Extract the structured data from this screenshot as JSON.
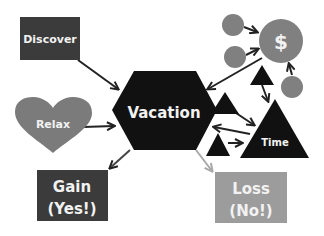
{
  "diagram": {
    "nodes": {
      "discover": {
        "label": "Discover",
        "shape": "rectangle",
        "color": "#3b3b3b"
      },
      "relax": {
        "label": "Relax",
        "shape": "heart",
        "color": "#7b7b7b"
      },
      "vacation": {
        "label": "Vacation",
        "shape": "hexagon",
        "color": "#111111"
      },
      "gain": {
        "label_line1": "Gain",
        "label_line2": "(Yes!)",
        "shape": "rectangle",
        "color": "#3b3b3b"
      },
      "loss": {
        "label_line1": "Loss",
        "label_line2": "(No!)",
        "shape": "rectangle",
        "color": "#9c9c9c"
      },
      "money": {
        "label": "$",
        "shape": "circle",
        "color": "#808080"
      },
      "time": {
        "label": "Time",
        "shape": "triangle",
        "color": "#111111"
      }
    },
    "colors": {
      "arrow": "#222222",
      "loss_arrow": "#a8a8a8",
      "small_circle": "#808080",
      "small_triangle": "#111111",
      "text": "#f2f2f2"
    }
  }
}
